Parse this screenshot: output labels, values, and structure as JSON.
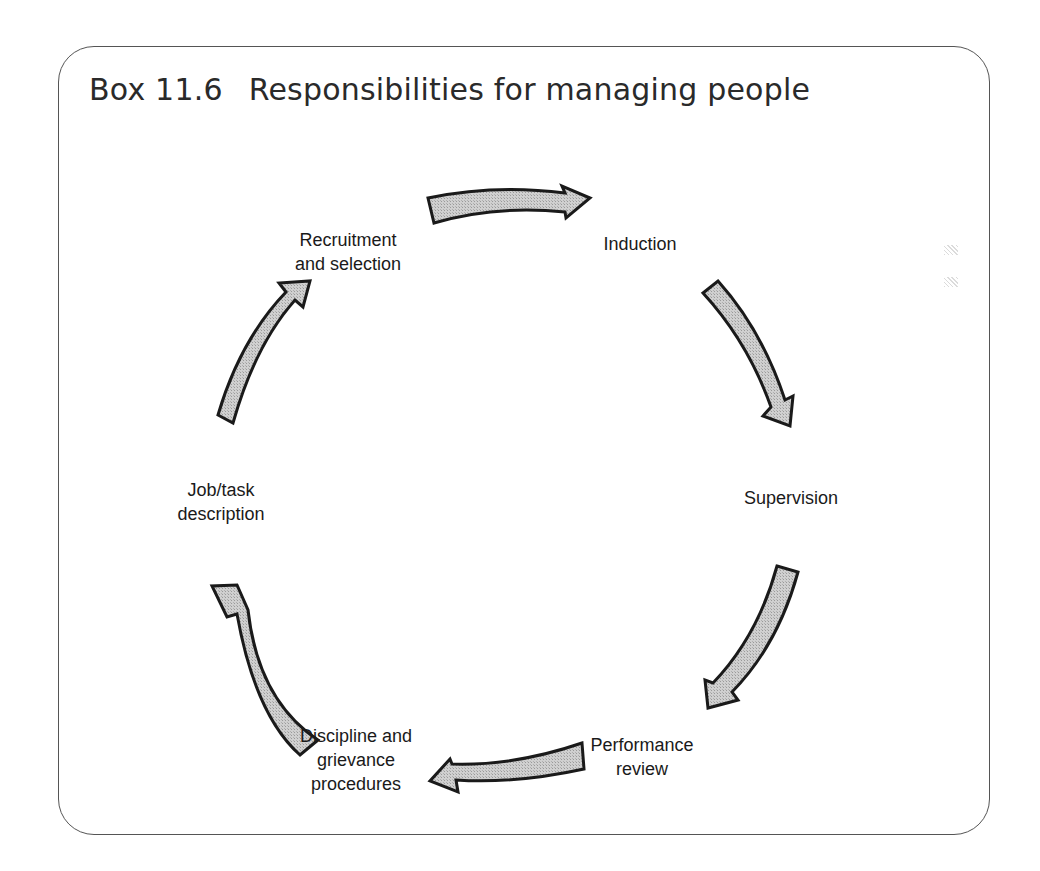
{
  "figure": {
    "box_label": "Box 11.6",
    "title": "Responsibilities for managing people",
    "cycle_stages": [
      {
        "id": "recruitment",
        "lines": [
          "Recruitment",
          "and selection"
        ]
      },
      {
        "id": "induction",
        "lines": [
          "Induction"
        ]
      },
      {
        "id": "supervision",
        "lines": [
          "Supervision"
        ]
      },
      {
        "id": "performance-review",
        "lines": [
          "Performance",
          "review"
        ]
      },
      {
        "id": "discipline",
        "lines": [
          "Discipline and",
          "grievance",
          "procedures"
        ]
      },
      {
        "id": "job-description",
        "lines": [
          "Job/task",
          "description"
        ]
      }
    ],
    "flow": [
      {
        "from": "Recruitment and selection",
        "to": "Induction"
      },
      {
        "from": "Induction",
        "to": "Supervision"
      },
      {
        "from": "Supervision",
        "to": "Performance review"
      },
      {
        "from": "Performance review",
        "to": "Discipline and grievance procedures"
      },
      {
        "from": "Discipline and grievance procedures",
        "to": "Job/task description"
      },
      {
        "from": "Job/task description",
        "to": "Recruitment and selection"
      }
    ],
    "colors": {
      "arrow_fill": "#c4c4c4",
      "arrow_stroke": "#1a1a1a",
      "border": "#555555",
      "text": "#1a1a1a"
    }
  }
}
